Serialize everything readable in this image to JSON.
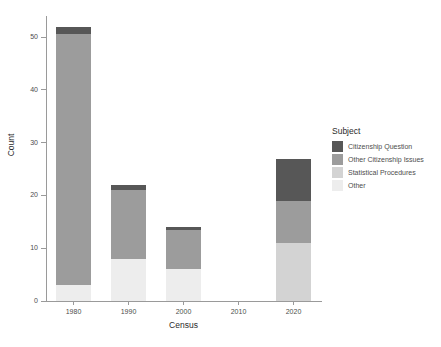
{
  "chart_data": {
    "type": "bar",
    "stacked": true,
    "title": "",
    "xlabel": "Census",
    "ylabel": "Count",
    "categories": [
      "1980",
      "1990",
      "2000",
      "2010",
      "2020"
    ],
    "xticklabels": [
      "1980",
      "1990",
      "2000",
      "2010",
      "2020"
    ],
    "yticklabels": [
      "0",
      "10",
      "20",
      "30",
      "40",
      "50"
    ],
    "ytickvalues": [
      0,
      10,
      20,
      30,
      40,
      50
    ],
    "ylim": [
      0,
      54
    ],
    "grid": false,
    "legend": {
      "title": "Subject",
      "position": "right"
    },
    "series": [
      {
        "name": "Citizenship Question",
        "color": "#575757",
        "values": [
          1.5,
          1,
          0.5,
          0,
          8
        ]
      },
      {
        "name": "Other Citizenship Issues",
        "color": "#9c9c9c",
        "values": [
          47.5,
          13,
          7.5,
          0,
          8
        ]
      },
      {
        "name": "Statistical Procedures",
        "color": "#d3d3d3",
        "values": [
          0,
          0,
          0,
          0,
          11
        ]
      },
      {
        "name": "Other",
        "color": "#ededed",
        "values": [
          3,
          8,
          6,
          0,
          0
        ]
      }
    ],
    "totals": [
      52,
      22,
      14,
      0,
      27
    ]
  },
  "legend_items": [
    {
      "label": "Citizenship Question",
      "color": "#575757"
    },
    {
      "label": "Other Citizenship Issues",
      "color": "#9c9c9c"
    },
    {
      "label": "Statistical Procedures",
      "color": "#d3d3d3"
    },
    {
      "label": "Other",
      "color": "#ededed"
    }
  ]
}
